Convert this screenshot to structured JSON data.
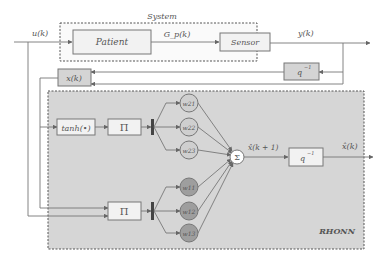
{
  "diagram": {
    "system": {
      "title": "System",
      "patient_label": "Patient",
      "transfer_label": "G_p(k)",
      "sensor_label": "Sensor"
    },
    "signals": {
      "input": "u(k)",
      "output": "y(k)",
      "state": "x(k)",
      "predicted_next": "x̂(k + 1)",
      "predicted": "x̂(k)"
    },
    "blocks": {
      "state_block": "x(k)",
      "delay_top": "q",
      "delay_top_exp": "−1",
      "delay_bottom": "q",
      "delay_bottom_exp": "−1",
      "tanh": "tanh(•)",
      "product_top": "Π",
      "product_bottom": "Π",
      "sum": "Σ"
    },
    "weights_upper": [
      "w21",
      "w22",
      "w23"
    ],
    "weights_lower": [
      "w11",
      "w12",
      "w13"
    ],
    "network_label": "RHONN",
    "colors": {
      "network_bg": "#d6d6d6",
      "weight_upper_fill": "#cfcfcf",
      "weight_lower_fill": "#9e9e9e",
      "line": "#777777"
    }
  }
}
